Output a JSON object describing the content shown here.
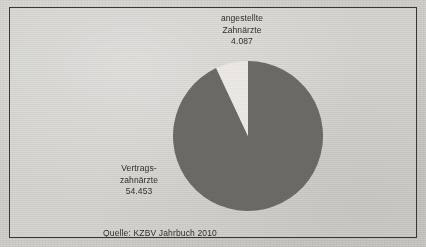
{
  "frame": {
    "border_color": "#3a3835",
    "background_color": "#d6d4cf"
  },
  "labels": {
    "angestellte": {
      "line1": "angestellte",
      "line2": "Zahnärzte",
      "value": "4.087"
    },
    "vertrags": {
      "line1": "Vertrags-",
      "line2": "zahnärzte",
      "value": "54.453"
    }
  },
  "source_note": "Quelle: KZBV Jahrbuch 2010",
  "ghost_text": {
    "g1": "der Zahnärzte in",
    "g2": "Deutschland nach",
    "g3": "Status der",
    "g4": "Tätigkeit im Jahr"
  },
  "chart_data": {
    "type": "pie",
    "title": "",
    "subtitle": "",
    "xlabel": "",
    "ylabel": "",
    "legend_position": "none",
    "grid": false,
    "labels_on_slices": true,
    "total": 58540,
    "categories": [
      "Vertragszahnärzte",
      "angestellte Zahnärzte"
    ],
    "values": [
      54453,
      4087
    ],
    "value_labels": [
      "54.453",
      "4.087"
    ],
    "percentages": [
      93.0,
      7.0
    ],
    "colors": [
      "#6b6a66",
      "#ece9e4"
    ],
    "start_angle_deg": 0,
    "direction": "counterclockwise",
    "slices": [
      {
        "name": "Vertragszahnärzte",
        "value": 54453,
        "value_label": "54.453",
        "percent": 93.0,
        "color": "#6b6a66",
        "sweep_deg": 334.9
      },
      {
        "name": "angestellte Zahnärzte",
        "value": 4087,
        "value_label": "4.087",
        "percent": 7.0,
        "color": "#ece9e4",
        "sweep_deg": 25.1
      }
    ],
    "geometry": {
      "center_x": 84,
      "center_y": 84,
      "radius": 75
    }
  }
}
